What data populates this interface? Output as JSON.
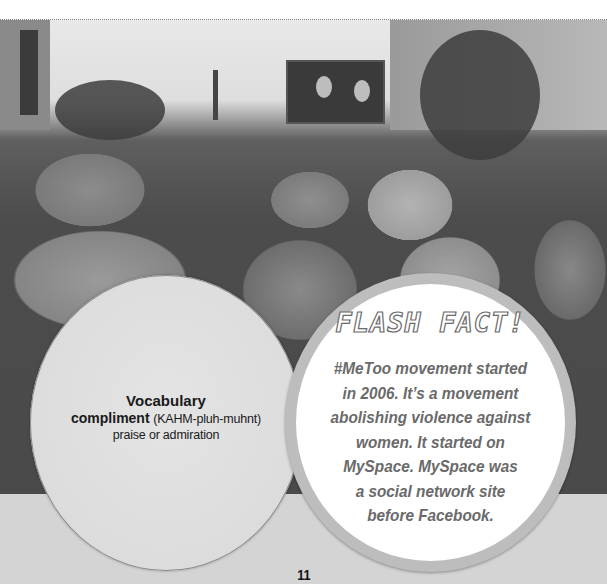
{
  "photo": {
    "description": "Black-and-white photo of a crowd wearing knit hats at a rally, facing a large video screen"
  },
  "vocabulary": {
    "heading": "Vocabulary",
    "word": "compliment",
    "pronunciation": "(KAHM-pluh-muhnt)",
    "definition": "praise or admiration"
  },
  "flash_fact": {
    "title": "FLASH FACT!",
    "lines": [
      "#MeToo movement started",
      "in 2006. It’s a movement",
      "abolishing violence against",
      "women. It started on",
      "MySpace. MySpace was",
      "a social network site",
      "before Facebook."
    ]
  },
  "page_number": "11",
  "colors": {
    "band": "#d4d4d4",
    "fact_ring": "#bdbdbd",
    "fact_text": "#6a6a6a",
    "vocab_bg": "#e0e0e0"
  }
}
